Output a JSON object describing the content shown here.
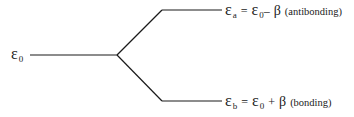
{
  "diagram": {
    "type": "energy-level-splitting",
    "levels": {
      "initial": {
        "symbol": "ε",
        "subscript": "0"
      },
      "antibonding": {
        "symbol": "ε",
        "subscript": "a",
        "equals": "=",
        "rhs_symbol": "ε",
        "rhs_subscript": "0",
        "operator": "–",
        "beta": "β",
        "note": "(antibonding)"
      },
      "bonding": {
        "symbol": "ε",
        "subscript": "b",
        "equals": "=",
        "rhs_symbol": "ε",
        "rhs_subscript": "0",
        "operator": "+",
        "beta": "β",
        "note": "(bonding)"
      }
    },
    "line_color": "#1a1a1a"
  }
}
